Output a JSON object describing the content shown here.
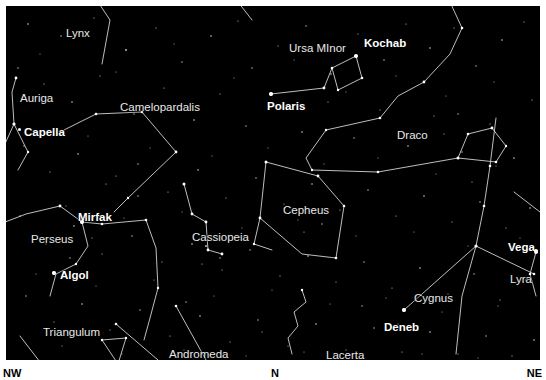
{
  "chart": {
    "type": "star-chart",
    "background_color": "#000000",
    "frame_color": "#ffffff",
    "line_color": "#d8d8d8",
    "star_color": "#ffffff",
    "label_color": "#f2f2f2",
    "sky_area": {
      "x": 6,
      "y": 6,
      "width": 534,
      "height": 354
    }
  },
  "compass": {
    "left": "NW",
    "center": "N",
    "right": "NE"
  },
  "constellations": [
    {
      "name": "Lynx",
      "label_x": 60,
      "label_y": 22
    },
    {
      "name": "Auriga",
      "label_x": 14,
      "label_y": 87
    },
    {
      "name": "Camelopardalis",
      "label_x": 114,
      "label_y": 96
    },
    {
      "name": "Ursa MInor",
      "label_x": 283,
      "label_y": 37
    },
    {
      "name": "Draco",
      "label_x": 391,
      "label_y": 124
    },
    {
      "name": "Perseus",
      "label_x": 25,
      "label_y": 228
    },
    {
      "name": "Cassiopeia",
      "label_x": 186,
      "label_y": 226
    },
    {
      "name": "Cepheus",
      "label_x": 277,
      "label_y": 199
    },
    {
      "name": "Triangulum",
      "label_x": 37,
      "label_y": 321
    },
    {
      "name": "Andromeda",
      "label_x": 163,
      "label_y": 343
    },
    {
      "name": "Lacerta",
      "label_x": 320,
      "label_y": 344
    },
    {
      "name": "Cygnus",
      "label_x": 408,
      "label_y": 287
    },
    {
      "name": "Lyra",
      "label_x": 504,
      "label_y": 268
    }
  ],
  "stars": [
    {
      "name": "Kochab",
      "label_x": 358,
      "label_y": 32,
      "dot_x": 353,
      "dot_y": 50
    },
    {
      "name": "Polaris",
      "label_x": 261,
      "label_y": 95,
      "dot_x": 271,
      "dot_y": 88
    },
    {
      "name": "Capella",
      "label_x": 18,
      "label_y": 121,
      "dot_x": 14,
      "dot_y": 124
    },
    {
      "name": "Mirfak",
      "label_x": 72,
      "label_y": 206,
      "dot_x": 78,
      "dot_y": 219
    },
    {
      "name": "Algol",
      "label_x": 54,
      "label_y": 264,
      "dot_x": 48,
      "dot_y": 267
    },
    {
      "name": "Vega",
      "label_x": 502,
      "label_y": 236,
      "dot_x": 530,
      "dot_y": 245
    },
    {
      "name": "Deneb",
      "label_x": 378,
      "label_y": 316,
      "dot_x": 404,
      "dot_y": 309
    }
  ]
}
